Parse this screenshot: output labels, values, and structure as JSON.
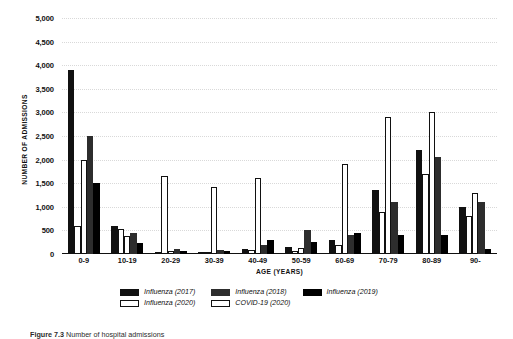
{
  "chart_data": {
    "type": "bar",
    "title": "",
    "xlabel": "AGE (YEARS)",
    "ylabel": "NUMBER OF ADMISSIONS",
    "ylim": [
      0,
      5000
    ],
    "ytick_step": 500,
    "grid": true,
    "legend_position": "bottom",
    "categories": [
      "0-9",
      "10-19",
      "20-29",
      "30-39",
      "40-49",
      "50-59",
      "60-69",
      "70-79",
      "80-89",
      "90-"
    ],
    "series": [
      {
        "name": "Influenza (2017)",
        "style": "filled-black",
        "color": "#111111",
        "values": [
          3900,
          600,
          50,
          50,
          100,
          150,
          300,
          1350,
          2200,
          1000
        ]
      },
      {
        "name": "Influenza (2020)",
        "style": "outline-white",
        "color": "#ffffff",
        "values": [
          600,
          520,
          1650,
          50,
          80,
          60,
          200,
          900,
          1700,
          800
        ]
      },
      {
        "name": "COVID-19 (2020)",
        "style": "outline-white",
        "color": "#ffffff",
        "values": [
          2000,
          390,
          60,
          1430,
          1600,
          120,
          1900,
          2900,
          3000,
          1300
        ]
      },
      {
        "name": "Influenza (2018)",
        "style": "filled-darkgray",
        "color": "#2d2d2d",
        "values": [
          2500,
          450,
          100,
          80,
          200,
          500,
          400,
          1100,
          2050,
          1100
        ]
      },
      {
        "name": "Influenza (2019)",
        "style": "filled-black",
        "color": "#000000",
        "values": [
          1500,
          230,
          60,
          60,
          300,
          250,
          450,
          400,
          400,
          100
        ]
      }
    ],
    "ytick_labels": [
      "0",
      "500",
      "1,000",
      "1,500",
      "2,000",
      "2,500",
      "3,000",
      "3,500",
      "4,000",
      "4,500",
      "5,000"
    ]
  },
  "legend": {
    "row1": [
      {
        "label": "Influenza (2017)",
        "swatch": "s-dark"
      },
      {
        "label": "Influenza (2018)",
        "swatch": "s-mid"
      },
      {
        "label": "Influenza (2019)",
        "swatch": "s-black"
      }
    ],
    "row2": [
      {
        "label": "Influenza (2020)",
        "swatch": "s-open"
      },
      {
        "label": "COVID-19 (2020)",
        "swatch": "s-open"
      }
    ]
  },
  "caption": {
    "label": "Figure 7.3",
    "text": "Number of hospital admissions"
  },
  "colors": {
    "influenza_2017": "#111111",
    "influenza_2018": "#2d2d2d",
    "influenza_2019": "#000000",
    "influenza_2020": "#ffffff",
    "covid_19_2020": "#ffffff",
    "gridline": "#d9d9d9",
    "axis": "#111111",
    "background": "#ffffff"
  }
}
